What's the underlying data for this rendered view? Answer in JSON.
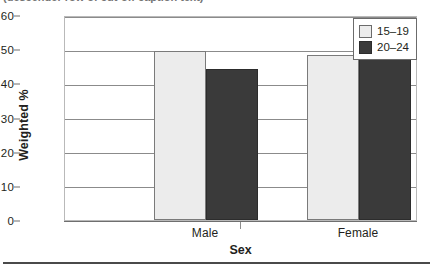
{
  "caption_sliver": "(descender row of cut-off caption text)",
  "chart_data": {
    "type": "bar",
    "title": "",
    "xlabel": "Sex",
    "ylabel": "Weighted %",
    "categories": [
      "Male",
      "Female"
    ],
    "series": [
      {
        "name": "15–19",
        "values": [
          49.5,
          48.2
        ],
        "color": "#ececec"
      },
      {
        "name": "20–24",
        "values": [
          44.3,
          53.5
        ],
        "color": "#3a3a3a"
      }
    ],
    "ylim": [
      0,
      60
    ],
    "yticks": [
      "0",
      "10",
      "20",
      "30",
      "40",
      "50",
      "60"
    ],
    "ytick_values": [
      0,
      10,
      20,
      30,
      40,
      50,
      60
    ],
    "grid": "horizontal",
    "legend_position": "top-right",
    "legend_entries": [
      "15–19",
      "20–24"
    ]
  },
  "legend": {
    "items": [
      {
        "label": "15–19",
        "swatch": "light"
      },
      {
        "label": "20–24",
        "swatch": "dark"
      }
    ]
  },
  "axes": {
    "y_title": "Weighted %",
    "x_title": "Sex"
  }
}
